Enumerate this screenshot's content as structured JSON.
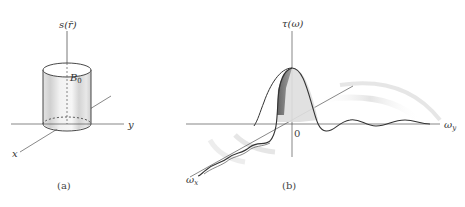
{
  "panel_a": {
    "caption": "(a)",
    "vertical_axis_label": "s(r̄)",
    "cylinder_label": "B",
    "cylinder_label_sub": "0",
    "x_axis_label": "x",
    "y_axis_label": "y"
  },
  "panel_b": {
    "caption": "(b)",
    "vertical_axis_label": "τ(ω)",
    "origin_label": "0",
    "wy_axis_label": "ω",
    "wy_axis_sub": "y",
    "wx_axis_label": "ω",
    "wx_axis_sub": "x"
  },
  "colors": {
    "line": "#333333",
    "axis": "#555555",
    "shade_light": "#d8d8d8",
    "shade_dark": "#666666"
  }
}
